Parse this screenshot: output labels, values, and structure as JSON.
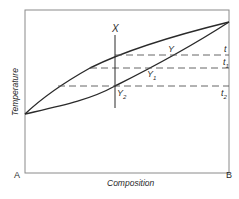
{
  "diagram": {
    "type": "binary phase diagram (liquidus / solidus)",
    "axes": {
      "xlabel": "Composition",
      "ylabel": "Temperature",
      "left_component": "A",
      "right_component": "B"
    },
    "labels": {
      "x": "X",
      "y": "Y",
      "y1": "Y",
      "y1_sub": "1",
      "y2": "Y",
      "y2_sub": "2",
      "t": "t",
      "t1": "t",
      "t1_sub": "1",
      "t2": "t",
      "t2_sub": "2"
    },
    "curves": [
      {
        "name": "upper curve (liquidus)",
        "from": "A melting point",
        "to": "B melting point"
      },
      {
        "name": "lower curve (solidus)",
        "from": "A melting point",
        "to": "B melting point"
      }
    ],
    "isotherms": [
      "t",
      "t1",
      "t2"
    ],
    "colors": {
      "line": "#2a2a2a",
      "dashed": "#555555",
      "frame": "#8a8a8a",
      "background": "#ffffff"
    }
  }
}
